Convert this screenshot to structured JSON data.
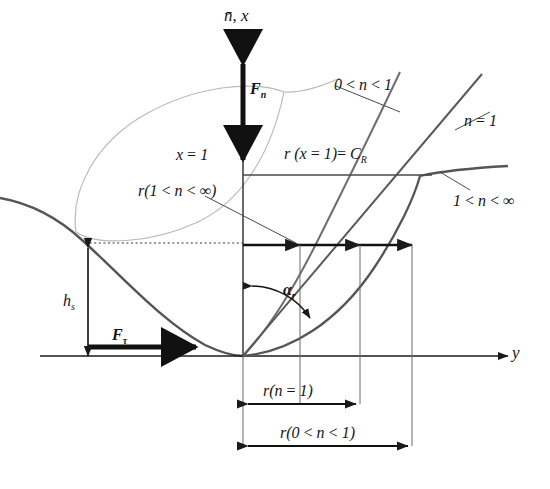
{
  "figure": {
    "type": "technical-diagram",
    "axes": {
      "vertical_label": "n̄ , x",
      "vertical_axis_name": "x-axis",
      "horizontal_label": "y",
      "horizontal_axis_name": "y-axis"
    },
    "colors": {
      "ink": "#1a1a1a",
      "dark_curve": "#4a4a4a",
      "light_curve": "#b4b4b4",
      "mid_curve": "#6e6e6e",
      "thin_rule": "#5a5a5a",
      "dotted": "#3a3a3a"
    },
    "labels": [
      {
        "id": "axis-x",
        "text": "n̄ , x",
        "x": 228,
        "y": 8,
        "size": 17
      },
      {
        "id": "axis-y",
        "text": "y",
        "x": 512,
        "y": 345,
        "size": 17
      },
      {
        "id": "force-normal",
        "text": "F",
        "sub": "n",
        "x": 249,
        "y": 82,
        "size": 16
      },
      {
        "id": "force-shear",
        "text": "F",
        "sub": "τ",
        "x": 110,
        "y": 330,
        "size": 16
      },
      {
        "id": "height",
        "text": "h",
        "sub": "s",
        "x": 64,
        "y": 296,
        "size": 16
      },
      {
        "id": "alpha-r",
        "text": "α",
        "sub": "r",
        "x": 284,
        "y": 286,
        "size": 16
      },
      {
        "id": "x-equals-1",
        "text": "x = 1",
        "x": 178,
        "y": 148,
        "size": 16
      },
      {
        "id": "r-at-x1",
        "text": "r (x = 1) = C",
        "sub": "R",
        "x": 285,
        "y": 147,
        "size": 16
      },
      {
        "id": "n-between-0-1",
        "text": "0 < n < 1",
        "x": 336,
        "y": 78,
        "size": 16
      },
      {
        "id": "n-equals-1",
        "text": "n = 1",
        "x": 466,
        "y": 115,
        "size": 16
      },
      {
        "id": "n-gt-1",
        "text": "1 < n < ∞",
        "x": 455,
        "y": 196,
        "size": 16
      },
      {
        "id": "r-1-to-inf",
        "text": "r(1 < n < ∞)",
        "x": 140,
        "y": 186,
        "size": 16
      },
      {
        "id": "dim-n-eq-1",
        "text": "r(n = 1)",
        "x": 276,
        "y": 386,
        "size": 16
      },
      {
        "id": "dim-n-0-1",
        "text": "r(0 < n < 1)",
        "x": 293,
        "y": 429,
        "size": 16
      }
    ],
    "curves": [
      {
        "name": "n-between-0-1-curve",
        "style": "mid",
        "note": "steep concave profile rising left of convergence"
      },
      {
        "name": "n-equals-1-curve",
        "style": "dark",
        "note": "straight ray through origin at angle alpha_r"
      },
      {
        "name": "n-greater-1-curve",
        "style": "dark",
        "note": "shallow convex profile flattening to the right"
      },
      {
        "name": "leaf-outline",
        "style": "light",
        "note": "light lens/leaf shaped closed outline upper-left"
      },
      {
        "name": "descending-wall",
        "style": "dark",
        "note": "dark U shaped wall descending from upper-left to origin"
      }
    ],
    "markers": {
      "convergence_point": {
        "x": 420,
        "y": 175,
        "label": "common intersection of all r-curves"
      },
      "origin": {
        "x": 243,
        "y": 355
      }
    },
    "guides": [
      {
        "name": "dotted-height-guide",
        "orientation": "horizontal"
      },
      {
        "name": "r-level-arrow-line",
        "orientation": "horizontal",
        "arrowheads": 3
      },
      {
        "name": "cr-level-line",
        "orientation": "horizontal"
      }
    ]
  }
}
